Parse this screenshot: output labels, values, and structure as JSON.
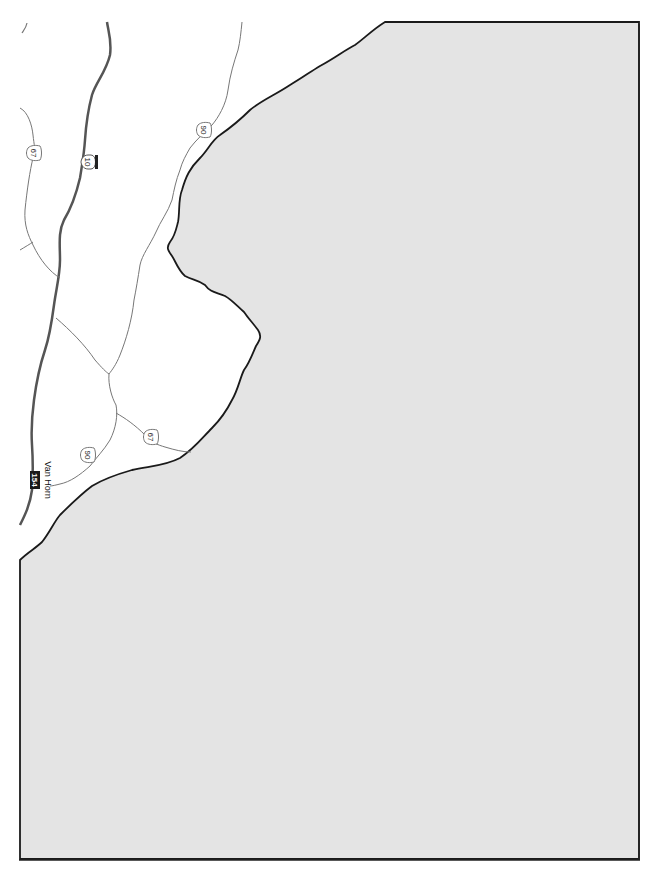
{
  "map": {
    "orientation": "rotated-90-clockwise",
    "colors": {
      "background": "#ffffff",
      "shaded_area": "#e4e4e4",
      "boundary": "#1a1a1a",
      "interstate_road": "#555555",
      "us_road": "#777777",
      "frame": "#222222"
    },
    "places": [
      {
        "name": "Van Horn",
        "label": "Van Horn"
      }
    ],
    "routes": [
      {
        "id": "i10",
        "type": "interstate",
        "label": "10",
        "icon": "interstate-shield-icon"
      },
      {
        "id": "us90_north",
        "type": "us-highway",
        "label": "90",
        "icon": "us-highway-shield-icon"
      },
      {
        "id": "us90_south",
        "type": "us-highway",
        "label": "90",
        "icon": "us-highway-shield-icon"
      },
      {
        "id": "us67_north",
        "type": "us-highway",
        "label": "67",
        "icon": "us-highway-shield-icon"
      },
      {
        "id": "us67_south",
        "type": "us-highway",
        "label": "67",
        "icon": "us-highway-shield-icon"
      },
      {
        "id": "exit154",
        "type": "exit-marker",
        "label": "154",
        "icon": "exit-number-icon"
      }
    ]
  }
}
